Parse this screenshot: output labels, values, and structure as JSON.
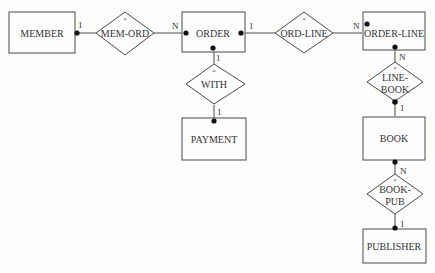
{
  "diagram": {
    "type": "entity-relationship",
    "entities": [
      {
        "id": "member",
        "label": "MEMBER"
      },
      {
        "id": "order",
        "label": "ORDER"
      },
      {
        "id": "order_line",
        "label": "ORDER-LINE"
      },
      {
        "id": "payment",
        "label": "PAYMENT"
      },
      {
        "id": "book",
        "label": "BOOK"
      },
      {
        "id": "publisher",
        "label": "PUBLISHER"
      }
    ],
    "relationships": [
      {
        "id": "mem_ord",
        "label": "MEM-ORD",
        "marker": "*"
      },
      {
        "id": "ord_line",
        "label": "ORD-LINE",
        "marker": "*"
      },
      {
        "id": "with",
        "label": "WITH",
        "marker": "*"
      },
      {
        "id": "line_book",
        "label_line1": "LINE-",
        "label_line2": "BOOK",
        "marker": "*"
      },
      {
        "id": "book_pub",
        "label_line1": "BOOK-",
        "label_line2": "PUB",
        "marker": "*"
      }
    ],
    "cardinalities": {
      "member_mem_ord": "1",
      "mem_ord_order": "N",
      "order_ord_line": "1",
      "ord_line_order_line": "N",
      "order_with": "1",
      "with_payment": "1",
      "order_line_line_book": "N",
      "line_book_book": "1",
      "book_book_pub": "N",
      "book_pub_publisher": "1"
    }
  }
}
